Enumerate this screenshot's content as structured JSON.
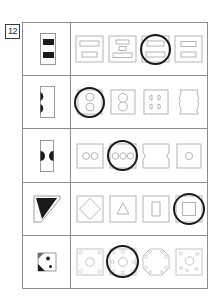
{
  "worksheet": {
    "item_number": "12",
    "type": "visual-matching-multiple-choice",
    "line_color": "#8c8c8c",
    "shape_color": "#b4b4b4",
    "fill_color": "#1b1b1b",
    "ring_color": "#1b1b1b"
  },
  "rows": [
    {
      "id": "row-1",
      "prompt": {
        "name": "rectangle-with-two-black-bars",
        "description": "upright rectangle containing two solid black horizontal bars"
      },
      "options": [
        {
          "name": "two-light-bars-long-top",
          "selected": false
        },
        {
          "name": "three-light-bars-stacked",
          "selected": false
        },
        {
          "name": "two-light-bars-matching",
          "selected": true
        },
        {
          "name": "two-light-bars-short",
          "selected": false
        }
      ],
      "answer_index": 2
    },
    {
      "id": "row-2",
      "prompt": {
        "name": "rectangle-with-two-black-half-circles-left",
        "description": "upright rectangle with two black half circles on the left edge"
      },
      "options": [
        {
          "name": "square-with-two-circles-vertical",
          "selected": true
        },
        {
          "name": "square-with-figure-eight",
          "selected": false
        },
        {
          "name": "square-with-four-small-lobes",
          "selected": false
        },
        {
          "name": "shape-with-wavy-sides",
          "selected": false
        }
      ],
      "answer_index": 0
    },
    {
      "id": "row-3",
      "prompt": {
        "name": "rectangle-with-black-half-circles-both-edges",
        "description": "upright rectangle with black half circles on left and right edges"
      },
      "options": [
        {
          "name": "square-with-two-circles-horizontal",
          "selected": false
        },
        {
          "name": "square-with-three-circles-horizontal",
          "selected": true
        },
        {
          "name": "square-with-side-notches",
          "selected": false
        },
        {
          "name": "square-with-one-circle",
          "selected": false
        }
      ],
      "answer_index": 1
    },
    {
      "id": "row-4",
      "prompt": {
        "name": "square-with-black-triangle-wedge",
        "description": "square with a solid black triangular wedge in the corner"
      },
      "options": [
        {
          "name": "square-with-diamond",
          "selected": false
        },
        {
          "name": "square-with-triangle",
          "selected": false
        },
        {
          "name": "square-with-tall-rectangle",
          "selected": false
        },
        {
          "name": "square-with-square",
          "selected": true
        }
      ],
      "answer_index": 3
    },
    {
      "id": "row-5",
      "prompt": {
        "name": "square-with-black-dots-and-corner-wedge",
        "description": "small square with black dots and a dark corner wedge"
      },
      "options": [
        {
          "name": "square-with-corner-dots-and-center-circle",
          "selected": false
        },
        {
          "name": "square-with-eight-dots-and-center-circle",
          "selected": true
        },
        {
          "name": "octagon-with-corner-dots",
          "selected": false
        },
        {
          "name": "square-with-scattered-dots-and-circle",
          "selected": false
        }
      ],
      "answer_index": 1
    }
  ]
}
